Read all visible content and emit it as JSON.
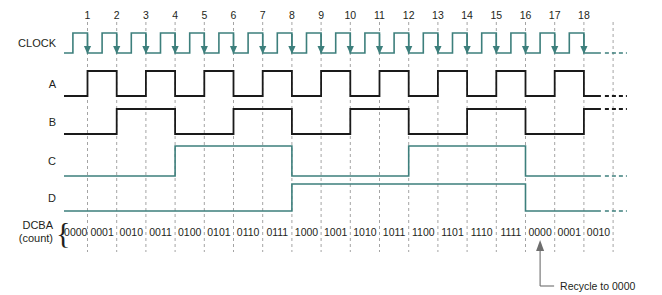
{
  "figure": {
    "type": "digital-timing-diagram",
    "title_absent": true,
    "annotation": "Recycle to 0000",
    "background": "#ffffff",
    "colors": {
      "clock_teal": "#3d7f7c",
      "signal_black": "#1a1a1a",
      "gridline_gray": "#9a9a9a",
      "leader_gray": "#6e6e6e",
      "text": "#231f20"
    }
  },
  "row_labels": {
    "clock": "CLOCK",
    "a": "A",
    "b": "B",
    "c": "C",
    "d": "D",
    "count_line1": "DCBA",
    "count_line2": "(count)",
    "brace": "{"
  },
  "clock_numbers": [
    "1",
    "2",
    "3",
    "4",
    "5",
    "6",
    "7",
    "8",
    "9",
    "10",
    "11",
    "12",
    "13",
    "14",
    "15",
    "16",
    "17",
    "18"
  ],
  "count_values": [
    "0000",
    "0001",
    "0010",
    "0011",
    "0100",
    "0101",
    "0110",
    "0111",
    "1000",
    "1001",
    "1010",
    "1011",
    "1100",
    "1101",
    "1110",
    "1111",
    "0000",
    "0001",
    "0010"
  ],
  "chart_data": {
    "type": "line",
    "xlabel": "Clock pulse number",
    "ylabel": "Logic level",
    "x": [
      1,
      2,
      3,
      4,
      5,
      6,
      7,
      8,
      9,
      10,
      11,
      12,
      13,
      14,
      15,
      16,
      17,
      18
    ],
    "axis_note": "Each signal toggles on the negative (falling) edge of CLOCK, marked with down arrows.",
    "series": [
      {
        "name": "CLOCK",
        "color": "#3d7f7c",
        "toggle_period_clocks": 1,
        "description": "Square wave; one pulse per numbered falling edge; 18 pulses shown then continues (dashed)."
      },
      {
        "name": "A",
        "color": "#1a1a1a",
        "weight": 1,
        "toggle_every_clocks": 1,
        "values": [
          1,
          0,
          1,
          0,
          1,
          0,
          1,
          0,
          1,
          0,
          1,
          0,
          1,
          0,
          1,
          0,
          1,
          0
        ],
        "description": "LSB; toggles on every clock falling edge."
      },
      {
        "name": "B",
        "color": "#1a1a1a",
        "weight": 2,
        "toggle_every_clocks": 2,
        "values": [
          0,
          1,
          1,
          0,
          0,
          1,
          1,
          0,
          0,
          1,
          1,
          0,
          0,
          1,
          1,
          0,
          0,
          1
        ],
        "description": "Toggles on every 2nd clock falling edge."
      },
      {
        "name": "C",
        "color": "#3d7f7c",
        "weight": 4,
        "toggle_every_clocks": 4,
        "values": [
          0,
          0,
          0,
          1,
          1,
          1,
          1,
          0,
          0,
          0,
          0,
          1,
          1,
          1,
          1,
          0,
          0,
          0
        ],
        "description": "Goes HIGH after clock 4 and 12; LOW after clock 8 and 16."
      },
      {
        "name": "D",
        "color": "#3d7f7c",
        "weight": 8,
        "toggle_every_clocks": 8,
        "values": [
          0,
          0,
          0,
          0,
          0,
          0,
          0,
          1,
          1,
          1,
          1,
          1,
          1,
          1,
          1,
          0,
          0,
          0
        ],
        "description": "MSB; goes HIGH after clock 8; LOW after clock 16 (recycle)."
      }
    ],
    "count_sequence": [
      "0000",
      "0001",
      "0010",
      "0011",
      "0100",
      "0101",
      "0110",
      "0111",
      "1000",
      "1001",
      "1010",
      "1011",
      "1100",
      "1101",
      "1110",
      "1111",
      "0000",
      "0001",
      "0010"
    ],
    "legend": "none",
    "grid": "vertical dashed gridlines at each clock falling edge"
  }
}
